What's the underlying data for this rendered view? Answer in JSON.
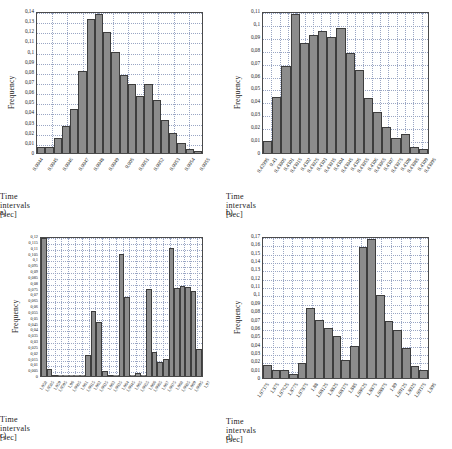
{
  "figure": {
    "axis_title": "Time intervals  [sec]",
    "y_axis_title": "Frequency",
    "bar_color": "#8c8c8c",
    "bar_edge_color": "#3d3d3d",
    "grid_color": "#9aa6c4",
    "frame_color": "#4a4a4a"
  },
  "panels": [
    {
      "tag": "a)",
      "chart_data": {
        "type": "bar",
        "title": "",
        "xlabel": "Time intervals  [sec]",
        "ylabel": "Frequency",
        "ylim": [
          0,
          0.14
        ],
        "ytick_values": [
          0,
          0.01,
          0.02,
          0.03,
          0.04,
          0.05,
          0.06,
          0.07,
          0.08,
          0.09,
          0.1,
          0.11,
          0.12,
          0.13,
          0.14
        ],
        "yticks": [
          "0",
          "0,01",
          "0,02",
          "0,03",
          "0,04",
          "0,05",
          "0,06",
          "0,07",
          "0,08",
          "0,09",
          "0,1",
          "0,11",
          "0,12",
          "0,13",
          "0,14"
        ],
        "xticks": [
          "0,0044",
          "0,0045",
          "0,0046",
          "0,0047",
          "0,0048",
          "0,0049",
          "0,005",
          "0,0051",
          "0,0052",
          "0,0053",
          "0,0054",
          "0,0055"
        ],
        "grid": true,
        "values": [
          0.006,
          0.006,
          0.015,
          0.027,
          0.043,
          0.081,
          0.132,
          0.137,
          0.119,
          0.1,
          0.077,
          0.068,
          0.056,
          0.068,
          0.052,
          0.033,
          0.02,
          0.01,
          0.004,
          0.002
        ],
        "n_bars": 20
      }
    },
    {
      "tag": "b)",
      "chart_data": {
        "type": "bar",
        "title": "",
        "xlabel": "Time intervals  [sec]",
        "ylabel": "Frequency",
        "ylim": [
          0,
          0.11
        ],
        "ytick_values": [
          0,
          0.01,
          0.02,
          0.03,
          0.04,
          0.05,
          0.06,
          0.07,
          0.08,
          0.09,
          0.1,
          0.11
        ],
        "yticks": [
          "0",
          "0,01",
          "0,02",
          "0,03",
          "0,04",
          "0,05",
          "0,06",
          "0,07",
          "0,08",
          "0,09",
          "0,1",
          "0,11"
        ],
        "xticks": [
          "0,42995",
          "0,43",
          "0,43005",
          "0,4301",
          "0,43015",
          "0,4302",
          "0,43025",
          "0,4303",
          "0,43035",
          "0,4304",
          "0,43045",
          "0,4305",
          "0,43055",
          "0,4306",
          "0,43065",
          "0,4307",
          "0,43075",
          "0,4308",
          "0,43085",
          "0,4309",
          "0,43095"
        ],
        "grid": true,
        "values": [
          0.0095,
          0.0435,
          0.0675,
          0.1075,
          0.085,
          0.0915,
          0.0945,
          0.0895,
          0.0965,
          0.0775,
          0.064,
          0.0425,
          0.0315,
          0.0205,
          0.0115,
          0.0145,
          0.005,
          0.003
        ],
        "n_bars": 18
      }
    },
    {
      "tag": "c)",
      "chart_data": {
        "type": "bar",
        "title": "",
        "xlabel": "Time intervals  [sec]",
        "ylabel": "Frequency",
        "ylim": [
          0,
          0.12
        ],
        "ytick_values": [
          0,
          0.005,
          0.01,
          0.015,
          0.02,
          0.025,
          0.03,
          0.035,
          0.04,
          0.045,
          0.05,
          0.055,
          0.06,
          0.065,
          0.07,
          0.075,
          0.08,
          0.085,
          0.09,
          0.095,
          0.1,
          0.105,
          0.11,
          0.115,
          0.12
        ],
        "yticks": [
          "0",
          "0,005",
          "0,01",
          "0,015",
          "0,02",
          "0,025",
          "0,03",
          "0,035",
          "0,04",
          "0,045",
          "0,05",
          "0,055",
          "0,06",
          "0,065",
          "0,07",
          "0,075",
          "0,08",
          "0,085",
          "0,09",
          "0,095",
          "0,1",
          "0,105",
          "0,11",
          "0,115",
          "0,12"
        ],
        "xticks": [
          "1,958",
          "1,9585",
          "1,959",
          "1,9595",
          "1,96",
          "1,9605",
          "1,961",
          "1,9615",
          "1,962",
          "1,9625",
          "1,963",
          "1,9635",
          "1,964",
          "1,9645",
          "1,965",
          "1,9655",
          "1,966",
          "1,9665",
          "1,967",
          "1,9675",
          "1,968",
          "1,9685",
          "1,969",
          "1,9695",
          "1,97"
        ],
        "grid": true,
        "values": [
          0.1185,
          0.006,
          0.001,
          0.0,
          0.0,
          0.0,
          0.0,
          0.0,
          0.018,
          0.056,
          0.046,
          0.004,
          0.001,
          0.0,
          0.105,
          0.068,
          0.0,
          0.003,
          0.0,
          0.075,
          0.021,
          0.012,
          0.015,
          0.11,
          0.0755,
          0.0775,
          0.0765,
          0.0725,
          0.023
        ],
        "n_bars": 29
      }
    },
    {
      "tag": "d)",
      "chart_data": {
        "type": "bar",
        "title": "",
        "xlabel": "Time intervals  [sec]",
        "ylabel": "Frequency",
        "ylim": [
          0,
          0.17
        ],
        "ytick_values": [
          0,
          0.01,
          0.02,
          0.03,
          0.04,
          0.05,
          0.06,
          0.07,
          0.08,
          0.09,
          0.1,
          0.11,
          0.12,
          0.13,
          0.14,
          0.15,
          0.16,
          0.17
        ],
        "yticks": [
          "0",
          "0,01",
          "0,02",
          "0,03",
          "0,04",
          "0,05",
          "0,06",
          "0,07",
          "0,08",
          "0,09",
          "0,1",
          "0,11",
          "0,12",
          "0,13",
          "0,14",
          "0,15",
          "0,16",
          "0,17"
        ],
        "xticks": [
          "1,87375",
          "1,875",
          "1,87625",
          "1,8775",
          "1,87875",
          "1,88",
          "1,88125",
          "1,8825",
          "1,88375",
          "1,885",
          "1,88625",
          "1,8875",
          "1,88875",
          "1,89",
          "1,89125",
          "1,8925",
          "1,89375",
          "1,895"
        ],
        "grid": true,
        "values": [
          0.016,
          0.01,
          0.009,
          0.005,
          0.018,
          0.084,
          0.069,
          0.06,
          0.05,
          0.021,
          0.038,
          0.157,
          0.166,
          0.099,
          0.068,
          0.057,
          0.036,
          0.014,
          0.009
        ],
        "n_bars": 19
      }
    }
  ]
}
